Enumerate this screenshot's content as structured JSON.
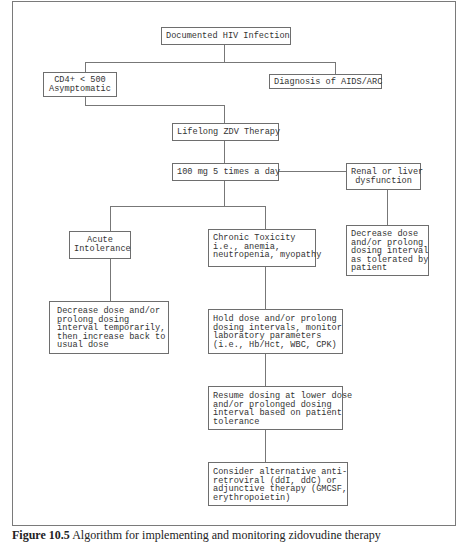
{
  "diagram": {
    "type": "flowchart",
    "nodes": {
      "n1": {
        "label": "Documented HIV Infection"
      },
      "n2": {
        "label": "CD4+ < 500\nAsymptomatic"
      },
      "n3": {
        "label": "Diagnosis of AIDS/ARC"
      },
      "n4": {
        "label": "Lifelong ZDV Therapy"
      },
      "n5": {
        "label": "100 mg 5 times a day"
      },
      "n6": {
        "label": "Renal or liver\ndysfunction"
      },
      "n7": {
        "label": "Decrease dose\nand/or prolong\ndosing interval\nas tolerated by\npatient"
      },
      "n8": {
        "label": "Acute\nIntolerance"
      },
      "n9": {
        "label": "Chronic Toxicity\ni.e., anemia,\nneutropenia, myopathy"
      },
      "n10": {
        "label": "Decrease dose and/or\nprolong dosing\ninterval temporarily,\nthen increase back to\nusual dose"
      },
      "n11": {
        "label": "Hold dose and/or prolong\ndosing intervals, monitor\nlaboratory parameters\n(i.e., Hb/Hct, WBC, CPK)"
      },
      "n12": {
        "label": "Resume dosing at lower dose\nand/or prolonged dosing\ninterval based on patient\ntolerance"
      },
      "n13": {
        "label": "Consider alternative anti-\nretroviral (ddI, ddC) or\nadjunctive therapy (GMCSF,\nerythropoietin)"
      }
    },
    "edges": [
      [
        "n1",
        "n2"
      ],
      [
        "n1",
        "n3"
      ],
      [
        "n2",
        "n4"
      ],
      [
        "n3",
        "n4"
      ],
      [
        "n4",
        "n5"
      ],
      [
        "n5",
        "n6"
      ],
      [
        "n6",
        "n7"
      ],
      [
        "n5",
        "n8"
      ],
      [
        "n5",
        "n9"
      ],
      [
        "n8",
        "n10"
      ],
      [
        "n9",
        "n11"
      ],
      [
        "n11",
        "n12"
      ],
      [
        "n12",
        "n13"
      ]
    ]
  },
  "caption": {
    "number": "Figure 10.5",
    "text": "Algorithm for implementing and monitoring zidovudine therapy"
  }
}
